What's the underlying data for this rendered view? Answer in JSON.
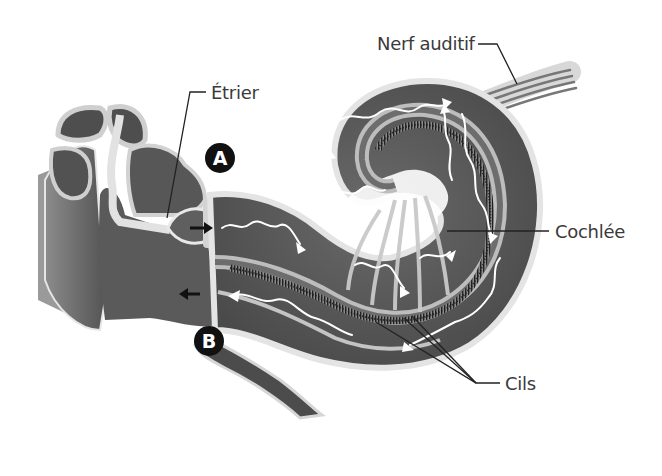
{
  "diagram": {
    "labels": {
      "nerf_auditif": "Nerf auditif",
      "etrier": "Étrier",
      "cochlee": "Cochlée",
      "cils": "Cils"
    },
    "markers": {
      "a": "A",
      "b": "B"
    },
    "colors": {
      "background": "#ffffff",
      "tissue_dark": "#555555",
      "tissue_mid": "#7a7a7a",
      "membrane_light": "#c8c8c8",
      "wave_arrows": "#ffffff",
      "leader_lines": "#222222",
      "label_text": "#3a3a3a",
      "marker_fill": "#111111"
    }
  }
}
